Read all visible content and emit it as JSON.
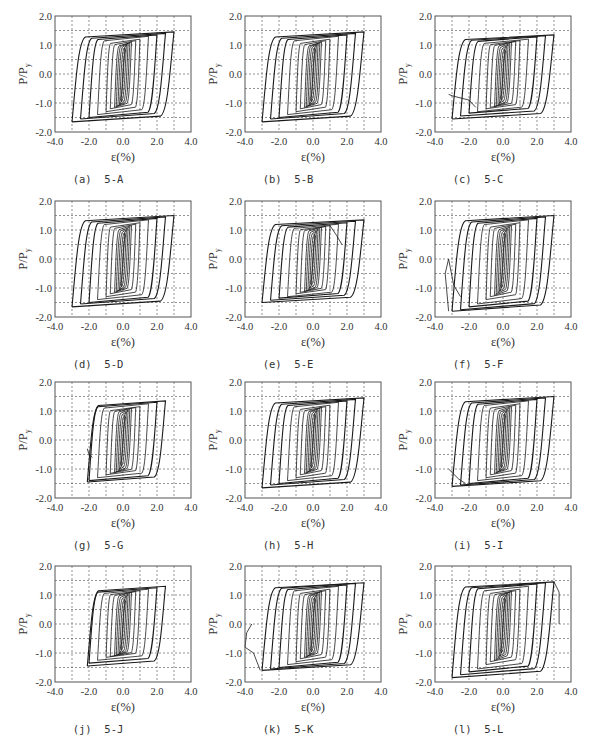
{
  "figure": {
    "panel_layout": {
      "cols": 3,
      "rows": 4
    }
  },
  "axes_common": {
    "xlabel": "ε(%)",
    "ylabel": "P/P",
    "ylabel_sub": "y",
    "xlim": [
      -4.0,
      4.0
    ],
    "ylim": [
      -2.0,
      2.0
    ],
    "xticks": [
      "-4.0",
      "-2.0",
      "0.0",
      "2.0",
      "4.0"
    ],
    "yticks": [
      "2.0",
      "1.0",
      "0.0",
      "-1.0",
      "-2.0"
    ],
    "grid": {
      "style": "dashed",
      "x_step": 1.0,
      "y_step": 0.5
    },
    "line_color": "#1a1a1a",
    "frame_color": "#555555",
    "grid_color": "#666666"
  },
  "chart_data": [
    {
      "type": "line",
      "id": "a",
      "caption": "(a)  5-A",
      "title": "5-A",
      "xlabel": "ε(%)",
      "ylabel": "P/Py",
      "xlim": [
        -4,
        4
      ],
      "ylim": [
        -2,
        2
      ],
      "grid": true,
      "series": [
        {
          "name": "hysteresis",
          "strain_amplitudes": [
            0.1,
            0.2,
            0.3,
            0.4,
            0.5,
            0.75,
            1.0,
            1.5,
            2.0,
            2.5,
            3.0
          ],
          "peak_pos": [
            0.9,
            1.0,
            1.05,
            1.08,
            1.1,
            1.15,
            1.2,
            1.3,
            1.35,
            1.4,
            1.45
          ],
          "peak_neg": [
            -0.95,
            -1.05,
            -1.1,
            -1.12,
            -1.15,
            -1.2,
            -1.3,
            -1.4,
            -1.5,
            -1.55,
            -1.65
          ],
          "min_strain": -3.0,
          "max_strain": 3.0
        }
      ]
    },
    {
      "type": "line",
      "id": "b",
      "caption": "(b)  5-B",
      "title": "5-B",
      "xlabel": "ε(%)",
      "ylabel": "P/Py",
      "xlim": [
        -4,
        4
      ],
      "ylim": [
        -2,
        2
      ],
      "grid": true,
      "series": [
        {
          "name": "hysteresis",
          "strain_amplitudes": [
            0.1,
            0.2,
            0.3,
            0.4,
            0.5,
            0.75,
            1.0,
            1.5,
            2.0,
            2.5,
            3.0
          ],
          "peak_pos": [
            0.9,
            1.0,
            1.05,
            1.08,
            1.1,
            1.15,
            1.2,
            1.3,
            1.35,
            1.4,
            1.45
          ],
          "peak_neg": [
            -0.95,
            -1.05,
            -1.1,
            -1.12,
            -1.15,
            -1.2,
            -1.3,
            -1.4,
            -1.5,
            -1.55,
            -1.65
          ],
          "min_strain": -3.0,
          "max_strain": 3.0
        }
      ]
    },
    {
      "type": "line",
      "id": "c",
      "caption": "(c)  5-C",
      "title": "5-C",
      "xlabel": "ε(%)",
      "ylabel": "P/Py",
      "xlim": [
        -4,
        4
      ],
      "ylim": [
        -2,
        2
      ],
      "grid": true,
      "series": [
        {
          "name": "hysteresis",
          "strain_amplitudes": [
            0.1,
            0.2,
            0.3,
            0.4,
            0.5,
            0.75,
            1.0,
            1.5,
            2.0,
            2.5,
            3.0
          ],
          "peak_pos": [
            0.85,
            0.95,
            1.0,
            1.05,
            1.1,
            1.12,
            1.15,
            1.2,
            1.28,
            1.32,
            1.35
          ],
          "peak_neg": [
            -0.9,
            -1.0,
            -1.05,
            -1.1,
            -1.12,
            -1.15,
            -1.2,
            -1.3,
            -1.35,
            -1.45,
            -1.55
          ],
          "min_strain": -3.2,
          "max_strain": 3.0,
          "failure_tail": [
            [
              -3.2,
              -0.7
            ],
            [
              -3.0,
              -0.75
            ],
            [
              -2.0,
              -0.9
            ],
            [
              -1.6,
              -1.15
            ]
          ]
        }
      ]
    },
    {
      "type": "line",
      "id": "d",
      "caption": "(d)  5-D",
      "title": "5-D",
      "xlabel": "ε(%)",
      "ylabel": "P/Py",
      "xlim": [
        -4,
        4
      ],
      "ylim": [
        -2,
        2
      ],
      "grid": true,
      "series": [
        {
          "name": "hysteresis",
          "strain_amplitudes": [
            0.1,
            0.2,
            0.3,
            0.4,
            0.5,
            0.75,
            1.0,
            1.5,
            2.0,
            2.5,
            3.0
          ],
          "peak_pos": [
            0.9,
            1.0,
            1.05,
            1.1,
            1.15,
            1.2,
            1.25,
            1.35,
            1.4,
            1.45,
            1.5
          ],
          "peak_neg": [
            -0.95,
            -1.05,
            -1.1,
            -1.12,
            -1.15,
            -1.2,
            -1.3,
            -1.4,
            -1.5,
            -1.55,
            -1.65
          ],
          "min_strain": -3.2,
          "max_strain": 3.0
        }
      ]
    },
    {
      "type": "line",
      "id": "e",
      "caption": "(e)  5-E",
      "title": "5-E",
      "xlabel": "ε(%)",
      "ylabel": "P/Py",
      "xlim": [
        -4,
        4
      ],
      "ylim": [
        -2,
        2
      ],
      "grid": true,
      "series": [
        {
          "name": "hysteresis",
          "strain_amplitudes": [
            0.1,
            0.2,
            0.3,
            0.4,
            0.5,
            0.75,
            1.0,
            1.5,
            2.0,
            2.5,
            3.0
          ],
          "peak_pos": [
            0.85,
            0.95,
            1.0,
            1.05,
            1.1,
            1.12,
            1.15,
            1.2,
            1.25,
            1.3,
            1.35
          ],
          "peak_neg": [
            -0.9,
            -1.0,
            -1.05,
            -1.1,
            -1.12,
            -1.15,
            -1.2,
            -1.3,
            -1.35,
            -1.42,
            -1.5
          ],
          "min_strain": -3.0,
          "max_strain": 3.0,
          "failure_tail": [
            [
              1.0,
              1.15
            ],
            [
              1.4,
              0.8
            ],
            [
              1.7,
              0.5
            ]
          ]
        }
      ]
    },
    {
      "type": "line",
      "id": "f",
      "caption": "(f)  5-F",
      "title": "5-F",
      "xlabel": "ε(%)",
      "ylabel": "P/Py",
      "xlim": [
        -4,
        4
      ],
      "ylim": [
        -2,
        2
      ],
      "grid": true,
      "series": [
        {
          "name": "hysteresis",
          "strain_amplitudes": [
            0.1,
            0.2,
            0.3,
            0.4,
            0.5,
            0.75,
            1.0,
            1.5,
            2.0,
            2.5,
            3.0
          ],
          "peak_pos": [
            0.9,
            1.0,
            1.05,
            1.1,
            1.15,
            1.2,
            1.25,
            1.35,
            1.4,
            1.45,
            1.5
          ],
          "peak_neg": [
            -1.0,
            -1.1,
            -1.15,
            -1.2,
            -1.25,
            -1.3,
            -1.4,
            -1.55,
            -1.65,
            -1.75,
            -1.8
          ],
          "min_strain": -3.2,
          "max_strain": 3.0,
          "failure_tail": [
            [
              -3.2,
              -1.8
            ],
            [
              -3.4,
              -0.5
            ],
            [
              -3.2,
              0.0
            ],
            [
              -2.9,
              -0.9
            ],
            [
              -2.5,
              -1.3
            ]
          ]
        }
      ]
    },
    {
      "type": "line",
      "id": "g",
      "caption": "(g)  5-G",
      "title": "5-G",
      "xlabel": "ε(%)",
      "ylabel": "P/Py",
      "xlim": [
        -4,
        4
      ],
      "ylim": [
        -2,
        2
      ],
      "grid": true,
      "series": [
        {
          "name": "hysteresis",
          "strain_amplitudes": [
            0.1,
            0.2,
            0.3,
            0.4,
            0.5,
            0.75,
            1.0,
            1.5,
            2.0,
            2.5
          ],
          "peak_pos": [
            0.85,
            0.95,
            1.0,
            1.05,
            1.1,
            1.12,
            1.15,
            1.25,
            1.3,
            1.35
          ],
          "peak_neg": [
            -0.9,
            -1.0,
            -1.05,
            -1.1,
            -1.12,
            -1.15,
            -1.2,
            -1.3,
            -1.4,
            -1.45
          ],
          "min_strain": -2.1,
          "max_strain": 2.6,
          "failure_tail": [
            [
              -2.1,
              -0.3
            ],
            [
              -2.0,
              -0.5
            ],
            [
              -1.8,
              -0.6
            ]
          ]
        }
      ]
    },
    {
      "type": "line",
      "id": "h",
      "caption": "(h)  5-H",
      "title": "5-H",
      "xlabel": "ε(%)",
      "ylabel": "P/Py",
      "xlim": [
        -4,
        4
      ],
      "ylim": [
        -2,
        2
      ],
      "grid": true,
      "series": [
        {
          "name": "hysteresis",
          "strain_amplitudes": [
            0.1,
            0.2,
            0.3,
            0.4,
            0.5,
            0.75,
            1.0,
            1.5,
            2.0,
            2.5,
            3.0
          ],
          "peak_pos": [
            0.9,
            1.0,
            1.05,
            1.1,
            1.12,
            1.15,
            1.2,
            1.3,
            1.35,
            1.4,
            1.45
          ],
          "peak_neg": [
            -0.95,
            -1.05,
            -1.1,
            -1.12,
            -1.15,
            -1.2,
            -1.3,
            -1.4,
            -1.5,
            -1.55,
            -1.65
          ],
          "min_strain": -3.0,
          "max_strain": 3.0
        }
      ]
    },
    {
      "type": "line",
      "id": "i",
      "caption": "(i)  5-I",
      "title": "5-I",
      "xlabel": "ε(%)",
      "ylabel": "P/Py",
      "xlim": [
        -4,
        4
      ],
      "ylim": [
        -2,
        2
      ],
      "grid": true,
      "series": [
        {
          "name": "hysteresis",
          "strain_amplitudes": [
            0.1,
            0.2,
            0.3,
            0.4,
            0.5,
            0.75,
            1.0,
            1.5,
            2.0,
            2.5,
            3.0
          ],
          "peak_pos": [
            0.9,
            1.0,
            1.05,
            1.1,
            1.15,
            1.2,
            1.25,
            1.35,
            1.4,
            1.45,
            1.5
          ],
          "peak_neg": [
            -0.95,
            -1.05,
            -1.1,
            -1.12,
            -1.15,
            -1.2,
            -1.3,
            -1.4,
            -1.5,
            -1.55,
            -1.6
          ],
          "min_strain": -3.2,
          "max_strain": 3.0,
          "failure_tail": [
            [
              -3.2,
              -1.0
            ],
            [
              -2.6,
              -1.35
            ],
            [
              -2.2,
              -1.5
            ]
          ]
        }
      ]
    },
    {
      "type": "line",
      "id": "j",
      "caption": "(j)  5-J",
      "title": "5-J",
      "xlabel": "ε(%)",
      "ylabel": "P/Py",
      "xlim": [
        -4,
        4
      ],
      "ylim": [
        -2,
        2
      ],
      "grid": true,
      "series": [
        {
          "name": "hysteresis",
          "strain_amplitudes": [
            0.1,
            0.2,
            0.3,
            0.4,
            0.5,
            0.75,
            1.0,
            1.5,
            2.0,
            2.5
          ],
          "peak_pos": [
            0.85,
            0.95,
            1.0,
            1.05,
            1.1,
            1.12,
            1.15,
            1.2,
            1.25,
            1.3
          ],
          "peak_neg": [
            -0.9,
            -1.0,
            -1.05,
            -1.08,
            -1.1,
            -1.12,
            -1.15,
            -1.25,
            -1.35,
            -1.45
          ],
          "min_strain": -2.1,
          "max_strain": 2.5
        }
      ]
    },
    {
      "type": "line",
      "id": "k",
      "caption": "(k)  5-K",
      "title": "5-K",
      "xlabel": "ε(%)",
      "ylabel": "P/Py",
      "xlim": [
        -4,
        4
      ],
      "ylim": [
        -2,
        2
      ],
      "grid": true,
      "series": [
        {
          "name": "hysteresis",
          "strain_amplitudes": [
            0.1,
            0.2,
            0.3,
            0.4,
            0.5,
            0.75,
            1.0,
            1.5,
            2.0,
            2.5,
            3.0
          ],
          "peak_pos": [
            0.9,
            1.0,
            1.05,
            1.1,
            1.12,
            1.15,
            1.2,
            1.3,
            1.35,
            1.4,
            1.42
          ],
          "peak_neg": [
            -0.95,
            -1.05,
            -1.1,
            -1.12,
            -1.15,
            -1.2,
            -1.3,
            -1.4,
            -1.5,
            -1.55,
            -1.6
          ],
          "min_strain": -3.1,
          "max_strain": 3.0,
          "failure_tail": [
            [
              -3.1,
              -1.6
            ],
            [
              -3.5,
              -1.0
            ],
            [
              -4.0,
              -0.8
            ],
            [
              -3.9,
              -0.3
            ],
            [
              -3.6,
              0.0
            ]
          ]
        }
      ]
    },
    {
      "type": "line",
      "id": "l",
      "caption": "(l)  5-L",
      "title": "5-L",
      "xlabel": "ε(%)",
      "ylabel": "P/Py",
      "xlim": [
        -4,
        4
      ],
      "ylim": [
        -2,
        2
      ],
      "grid": true,
      "series": [
        {
          "name": "hysteresis",
          "strain_amplitudes": [
            0.1,
            0.2,
            0.3,
            0.4,
            0.5,
            0.75,
            1.0,
            1.5,
            2.0,
            2.5,
            3.0
          ],
          "peak_pos": [
            0.9,
            1.0,
            1.05,
            1.1,
            1.12,
            1.15,
            1.2,
            1.3,
            1.38,
            1.42,
            1.45
          ],
          "peak_neg": [
            -1.0,
            -1.1,
            -1.15,
            -1.2,
            -1.25,
            -1.3,
            -1.4,
            -1.55,
            -1.65,
            -1.75,
            -1.85
          ],
          "min_strain": -3.1,
          "max_strain": 3.0,
          "failure_tail": [
            [
              3.0,
              1.45
            ],
            [
              3.3,
              1.1
            ],
            [
              3.3,
              0.0
            ]
          ]
        }
      ]
    }
  ]
}
